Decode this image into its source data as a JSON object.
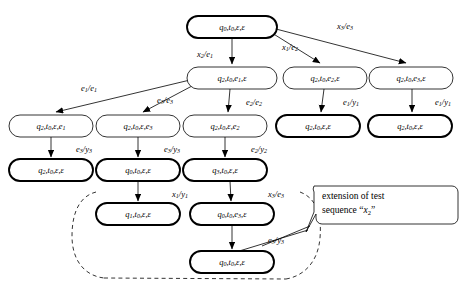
{
  "diagram": {
    "colors": {
      "stroke": "#000000",
      "fill": "#ffffff",
      "text": "#000000"
    },
    "nodes": [
      {
        "id": "n0",
        "q": "q",
        "qs": "0",
        "t": "t",
        "ts": "0",
        "a": "ε",
        "as": "",
        "b": "ε",
        "bs": "",
        "emphasis": "thick",
        "x": 232,
        "y": 27,
        "w": 90,
        "h": 22
      },
      {
        "id": "n1",
        "q": "q",
        "qs": "2",
        "t": "t",
        "ts": "0",
        "a": "e",
        "as": "1",
        "b": "ε",
        "bs": "",
        "emphasis": "thin",
        "x": 232,
        "y": 78,
        "w": 90,
        "h": 22
      },
      {
        "id": "n2",
        "q": "q",
        "qs": "2",
        "t": "t",
        "ts": "0",
        "a": "e",
        "as": "2",
        "b": "ε",
        "bs": "",
        "emphasis": "thin",
        "x": 325,
        "y": 78,
        "w": 84,
        "h": 22
      },
      {
        "id": "n3",
        "q": "q",
        "qs": "2",
        "t": "t",
        "ts": "0",
        "a": "e",
        "as": "3",
        "b": "ε",
        "bs": "",
        "emphasis": "thin",
        "x": 411,
        "y": 78,
        "w": 84,
        "h": 22
      },
      {
        "id": "n4",
        "q": "q",
        "qs": "2",
        "t": "t",
        "ts": "0",
        "a": "ε",
        "as": "",
        "b": "e",
        "bs": "1",
        "emphasis": "thin",
        "x": 51,
        "y": 126,
        "w": 84,
        "h": 22
      },
      {
        "id": "n5",
        "q": "q",
        "qs": "2",
        "t": "t",
        "ts": "0",
        "a": "ε",
        "as": "",
        "b": "e",
        "bs": "3",
        "emphasis": "thin",
        "x": 138,
        "y": 126,
        "w": 84,
        "h": 22
      },
      {
        "id": "n6",
        "q": "q",
        "qs": "2",
        "t": "t",
        "ts": "0",
        "a": "ε",
        "as": "",
        "b": "e",
        "bs": "2",
        "emphasis": "thin",
        "x": 225,
        "y": 126,
        "w": 84,
        "h": 22
      },
      {
        "id": "n7",
        "q": "q",
        "qs": "2",
        "t": "t",
        "ts": "0",
        "a": "ε",
        "as": "",
        "b": "ε",
        "bs": "",
        "emphasis": "thick",
        "x": 318,
        "y": 126,
        "w": 84,
        "h": 22
      },
      {
        "id": "n8",
        "q": "q",
        "qs": "2",
        "t": "t",
        "ts": "0",
        "a": "ε",
        "as": "",
        "b": "ε",
        "bs": "",
        "emphasis": "thick",
        "x": 410,
        "y": 126,
        "w": 84,
        "h": 22
      },
      {
        "id": "n9",
        "q": "q",
        "qs": "2",
        "t": "t",
        "ts": "0",
        "a": "ε",
        "as": "",
        "b": "ε",
        "bs": "",
        "emphasis": "thick",
        "x": 51,
        "y": 170,
        "w": 84,
        "h": 22
      },
      {
        "id": "n10",
        "q": "q",
        "qs": "0",
        "t": "t",
        "ts": "0",
        "a": "ε",
        "as": "",
        "b": "ε",
        "bs": "",
        "emphasis": "thick",
        "x": 138,
        "y": 170,
        "w": 84,
        "h": 22
      },
      {
        "id": "n11",
        "q": "q",
        "qs": "3",
        "t": "t",
        "ts": "0",
        "a": "ε",
        "as": "",
        "b": "ε",
        "bs": "",
        "emphasis": "thick",
        "x": 225,
        "y": 170,
        "w": 84,
        "h": 22
      },
      {
        "id": "n12",
        "q": "q",
        "qs": "1",
        "t": "t",
        "ts": "0",
        "a": "ε",
        "as": "",
        "b": "ε",
        "bs": "",
        "emphasis": "thick",
        "x": 138,
        "y": 214,
        "w": 84,
        "h": 22
      },
      {
        "id": "n13",
        "q": "q",
        "qs": "0",
        "t": "t",
        "ts": "0",
        "a": "e",
        "as": "3",
        "b": "ε",
        "bs": "",
        "emphasis": "thick",
        "x": 232,
        "y": 214,
        "w": 84,
        "h": 22
      },
      {
        "id": "n14",
        "q": "q",
        "qs": "0",
        "t": "t",
        "ts": "0",
        "a": "ε",
        "as": "",
        "b": "ε",
        "bs": "",
        "emphasis": "thick",
        "x": 232,
        "y": 262,
        "w": 84,
        "h": 22
      }
    ],
    "edge_labels": [
      {
        "id": "el-x2-e1",
        "input": "x",
        "input_sub": "2",
        "output": "e",
        "output_sub": "1",
        "x": 205,
        "y": 55
      },
      {
        "id": "el-x1-e2",
        "input": "x",
        "input_sub": "1",
        "output": "e",
        "output_sub": "2",
        "x": 290,
        "y": 48
      },
      {
        "id": "el-x3-e3",
        "input": "x",
        "input_sub": "3",
        "output": "e",
        "output_sub": "3",
        "x": 345,
        "y": 27
      },
      {
        "id": "el-e1-e1",
        "input": "e",
        "input_sub": "1",
        "output": "e",
        "output_sub": "1",
        "x": 89,
        "y": 89
      },
      {
        "id": "el-e3-e3",
        "input": "e",
        "input_sub": "3",
        "output": "e",
        "output_sub": "3",
        "x": 165,
        "y": 101
      },
      {
        "id": "el-e2-e2",
        "input": "e",
        "input_sub": "2",
        "output": "e",
        "output_sub": "2",
        "x": 254,
        "y": 103
      },
      {
        "id": "el-e1-y1",
        "input": "e",
        "input_sub": "1",
        "output": "y",
        "output_sub": "1",
        "x": 351,
        "y": 103
      },
      {
        "id": "el-e1-y1b",
        "input": "e",
        "input_sub": "1",
        "output": "y",
        "output_sub": "1",
        "x": 443,
        "y": 103
      },
      {
        "id": "el-e3-y3",
        "input": "e",
        "input_sub": "3",
        "output": "y",
        "output_sub": "3",
        "x": 84,
        "y": 150
      },
      {
        "id": "el-e3-y3b",
        "input": "e",
        "input_sub": "3",
        "output": "y",
        "output_sub": "3",
        "x": 172,
        "y": 150
      },
      {
        "id": "el-e2-y2",
        "input": "e",
        "input_sub": "2",
        "output": "y",
        "output_sub": "2",
        "x": 259,
        "y": 150
      },
      {
        "id": "el-x1-y1",
        "input": "x",
        "input_sub": "1",
        "output": "y",
        "output_sub": "1",
        "x": 180,
        "y": 195
      },
      {
        "id": "el-x3-e3b",
        "input": "x",
        "input_sub": "3",
        "output": "e",
        "output_sub": "3",
        "x": 276,
        "y": 195
      },
      {
        "id": "el-e3-y3c",
        "input": "e",
        "input_sub": "3",
        "output": "y",
        "output_sub": "3",
        "x": 276,
        "y": 241
      }
    ],
    "callout": {
      "line1": "extension of test",
      "line2_prefix": "sequence “",
      "line2_var": "x",
      "line2_sub": "2",
      "line2_suffix": "”"
    }
  }
}
